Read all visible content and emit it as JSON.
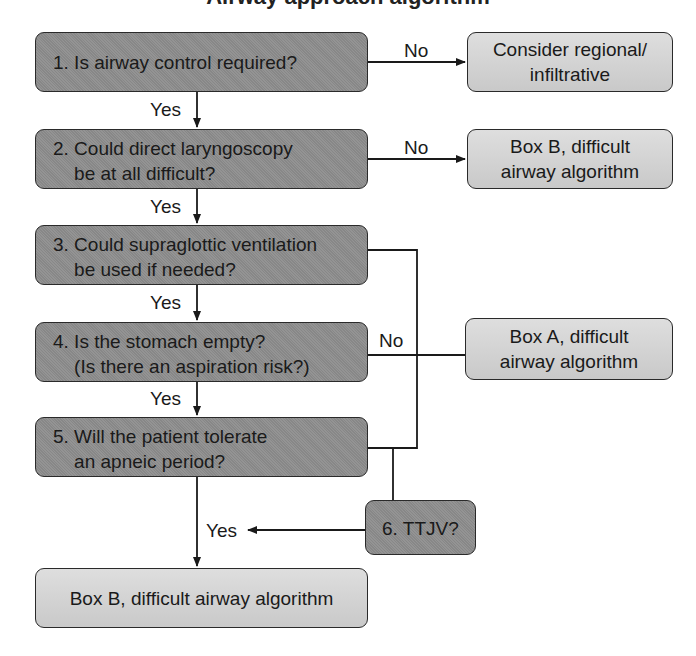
{
  "title": {
    "text": "Airway approach algorithm",
    "note": "clipped at top edge"
  },
  "questions": [
    {
      "id": 1,
      "text": "1. Is airway control required?"
    },
    {
      "id": 2,
      "text": "2. Could direct laryngoscopy\n    be at all difficult?"
    },
    {
      "id": 3,
      "text": "3. Could supraglottic ventilation\n    be used if needed?"
    },
    {
      "id": 4,
      "text": "4. Is the stomach empty?\n    (Is there an aspiration risk?)"
    },
    {
      "id": 5,
      "text": "5. Will the patient tolerate\n    an apneic period?"
    },
    {
      "id": 6,
      "text": "6. TTJV?"
    }
  ],
  "results": {
    "regional": "Consider regional/\ninfiltrative",
    "box_b_right": "Box B, difficult\nairway algorithm",
    "box_a": "Box A, difficult\nairway algorithm",
    "box_b_bottom": "Box B, difficult airway algorithm"
  },
  "labels": {
    "yes_1": "Yes",
    "yes_2": "Yes",
    "yes_3": "Yes",
    "yes_4": "Yes",
    "yes_6": "Yes",
    "no_1": "No",
    "no_2": "No",
    "no_4": "No"
  },
  "colors": {
    "question_fill": "#8d8d8d",
    "result_fill": "#cfcfcf",
    "line": "#1a1a1a"
  }
}
